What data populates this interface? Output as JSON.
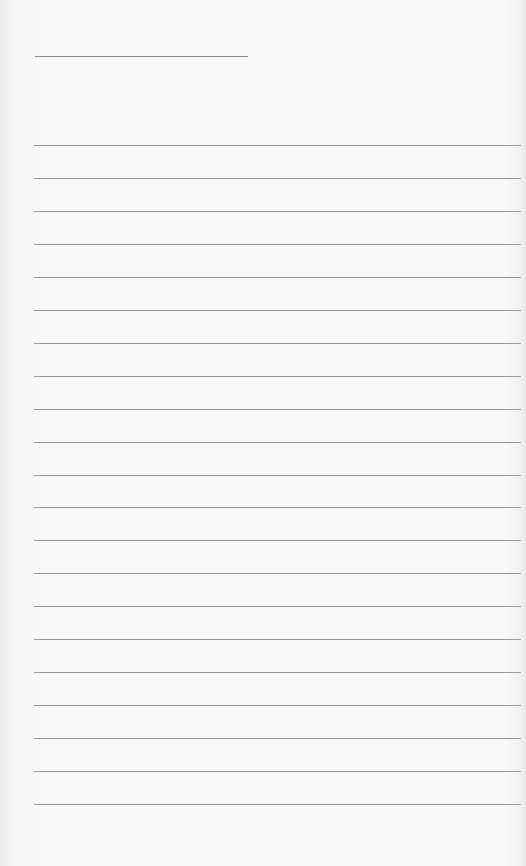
{
  "page": {
    "type": "lined-paper",
    "background_color": "#f8f8f8",
    "line_color": "#9a9a9a",
    "title_line": {
      "x": 35,
      "y": 56,
      "width": 213
    },
    "rules": {
      "count": 21,
      "x": 34,
      "width": 487,
      "start_y": 145,
      "spacing": 32.95
    }
  }
}
